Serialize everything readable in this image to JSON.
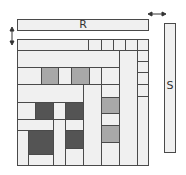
{
  "diagram": {
    "type": "mondrian-style rectangle packing",
    "labels": {
      "top_bar": "R",
      "side_bar": "S"
    },
    "colors": {
      "light": "#f0f0f0",
      "medium": "#a8a8a8",
      "dark": "#545454",
      "border": "#4a4a4a"
    },
    "arrows": [
      {
        "name": "vertical-double-arrow",
        "direction": "up-down",
        "position": "left of R bar"
      },
      {
        "name": "horizontal-double-arrow",
        "direction": "left-right",
        "position": "between R bar and S bar"
      }
    ]
  }
}
